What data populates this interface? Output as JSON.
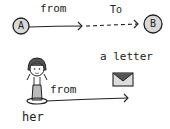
{
  "diagram": {
    "top": {
      "node_a": "A",
      "node_b": "B",
      "label_from": "from",
      "label_to": "To"
    },
    "bottom": {
      "person_label": "her",
      "arrow_label": "from",
      "object_label": "a letter",
      "icons": [
        "girl-figure-icon",
        "envelope-icon"
      ]
    },
    "colors": {
      "ink": "#222222",
      "fill": "#d8d8d8",
      "background": "#ffffff"
    }
  }
}
